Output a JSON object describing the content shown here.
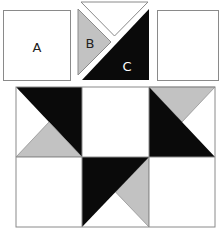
{
  "diagram": {
    "colors": {
      "white": "#ffffff",
      "gray": "#c2c2c2",
      "black": "#0a0a0a",
      "outline": "#8a8a8a"
    },
    "pieces": [
      {
        "id": "A",
        "label": "A",
        "shape": "square",
        "fill": "white"
      },
      {
        "id": "B",
        "label": "B",
        "shape": "triangle",
        "fill": "gray"
      },
      {
        "id": "C",
        "label": "C",
        "shape": "triangle",
        "fill": "black"
      },
      {
        "id": "top-triangle",
        "label": "",
        "shape": "triangle",
        "fill": "white"
      },
      {
        "id": "blank-square",
        "label": "",
        "shape": "square",
        "fill": "white"
      }
    ],
    "assembled_block": {
      "rows": 2,
      "columns": 3
    }
  }
}
